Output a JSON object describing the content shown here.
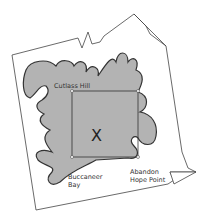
{
  "diagram": {
    "type": "treasure-map",
    "labels": {
      "cutlass_hill": "Cutlass Hill",
      "buccaneer_bay_1": "Buccaneer",
      "buccaneer_bay_2": "Bay",
      "abandon_1": "Abandon",
      "abandon_2": "Hope Point",
      "treasure": "X"
    },
    "colors": {
      "island": "#b3b3b3",
      "outline": "#333333",
      "paper": "#ffffff"
    }
  }
}
